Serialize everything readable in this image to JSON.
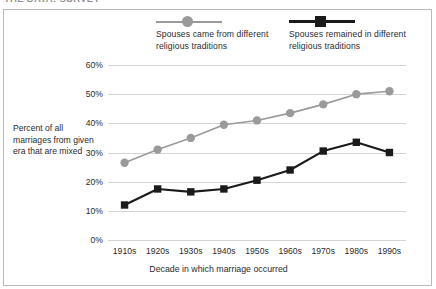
{
  "caption": {
    "text": "THE DATA: SURVEY"
  },
  "legend": {
    "position": "top",
    "items": [
      {
        "name": "series-mixed-origin",
        "label": "Spouses came from different religious traditions",
        "marker": "circle",
        "color": "#9a9a9a"
      },
      {
        "name": "series-remained-mixed",
        "label": "Spouses remained in different religious traditions",
        "marker": "square",
        "color": "#1a1a1a"
      }
    ]
  },
  "axes": {
    "ylabel": "Percent of all marriages from given era that are mixed",
    "xlabel": "Decade in which marriage occurred",
    "yticks": [
      "60%",
      "50%",
      "40%",
      "30%",
      "20%",
      "10%",
      "0%"
    ],
    "xticks": [
      "1910s",
      "1920s",
      "1930s",
      "1940s",
      "1950s",
      "1960s",
      "1970s",
      "1980s",
      "1990s"
    ]
  },
  "chart_data": {
    "type": "line",
    "title": "",
    "xlabel": "Decade in which marriage occurred",
    "ylabel": "Percent of all marriages from given era that are mixed",
    "categories": [
      "1910s",
      "1920s",
      "1930s",
      "1940s",
      "1950s",
      "1960s",
      "1970s",
      "1980s",
      "1990s"
    ],
    "series": [
      {
        "name": "Spouses came from different religious traditions",
        "color": "#9a9a9a",
        "marker": "circle",
        "values": [
          26.5,
          31,
          35,
          39.5,
          41,
          43.5,
          46.5,
          50,
          51
        ]
      },
      {
        "name": "Spouses remained in different religious traditions",
        "color": "#1a1a1a",
        "marker": "square",
        "values": [
          12,
          17.5,
          16.5,
          17.5,
          20.5,
          24,
          30.5,
          33.5,
          30
        ]
      }
    ],
    "ylim": [
      0,
      60
    ],
    "ytick_values": [
      0,
      10,
      20,
      30,
      40,
      50,
      60
    ],
    "ytick_suffix": "%",
    "grid": true,
    "legend_position": "top"
  }
}
